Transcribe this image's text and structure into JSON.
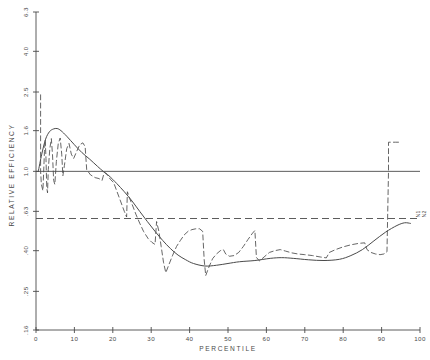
{
  "chart_data": {
    "type": "line",
    "title": "",
    "xlabel": "PERCENTILE",
    "ylabel": "RELATIVE  EFFICIENCY",
    "xlim": [
      0,
      100
    ],
    "ylim_log": [
      0.16,
      6.3
    ],
    "yscale": "log",
    "grid": false,
    "legend": "none",
    "xticks": [
      "0",
      "10",
      "20",
      "30",
      "40",
      "50",
      "60",
      "70",
      "80",
      "90",
      "100"
    ],
    "xtick_values": [
      0,
      10,
      20,
      30,
      40,
      50,
      60,
      70,
      80,
      90,
      100
    ],
    "yticks": [
      "6.3",
      "4.0",
      "2.5",
      "1.6",
      "1.0",
      ".63",
      ".40",
      ".25",
      ".16"
    ],
    "ytick_values": [
      6.3,
      4.0,
      2.5,
      1.6,
      1.0,
      0.63,
      0.4,
      0.25,
      0.16
    ],
    "right_annotation": "N1 N2",
    "right_annotation_line1": "N1",
    "right_annotation_line2": "N2",
    "reference_lines": [
      {
        "name": "unity-line",
        "y": 1.0,
        "style": "solid"
      },
      {
        "name": "lower-reference-line",
        "y": 0.58,
        "style": "dashed"
      }
    ],
    "series": [
      {
        "name": "smooth-efficiency-curve",
        "style": "solid",
        "points": [
          [
            0.6,
            1.0
          ],
          [
            1.5,
            1.22
          ],
          [
            2.5,
            1.45
          ],
          [
            3.5,
            1.58
          ],
          [
            4.5,
            1.63
          ],
          [
            5.5,
            1.64
          ],
          [
            6.5,
            1.6
          ],
          [
            8.0,
            1.5
          ],
          [
            10.0,
            1.36
          ],
          [
            12.0,
            1.24
          ],
          [
            14.0,
            1.15
          ],
          [
            16.0,
            1.06
          ],
          [
            17.5,
            1.0
          ],
          [
            19.0,
            0.95
          ],
          [
            21.0,
            0.87
          ],
          [
            23.0,
            0.79
          ],
          [
            25.0,
            0.71
          ],
          [
            27.0,
            0.63
          ],
          [
            29.0,
            0.56
          ],
          [
            31.0,
            0.5
          ],
          [
            33.0,
            0.45
          ],
          [
            35.0,
            0.41
          ],
          [
            37.0,
            0.38
          ],
          [
            39.0,
            0.36
          ],
          [
            41.0,
            0.345
          ],
          [
            44.0,
            0.335
          ],
          [
            47.0,
            0.338
          ],
          [
            50.0,
            0.345
          ],
          [
            53.0,
            0.352
          ],
          [
            57.0,
            0.357
          ],
          [
            61.0,
            0.366
          ],
          [
            64.0,
            0.369
          ],
          [
            67.0,
            0.366
          ],
          [
            71.0,
            0.36
          ],
          [
            75.0,
            0.357
          ],
          [
            79.0,
            0.362
          ],
          [
            82.0,
            0.378
          ],
          [
            85.0,
            0.405
          ],
          [
            88.0,
            0.448
          ],
          [
            91.0,
            0.495
          ],
          [
            94.0,
            0.535
          ],
          [
            96.0,
            0.552
          ],
          [
            97.5,
            0.548
          ]
        ]
      },
      {
        "name": "empirical-efficiency-curve",
        "style": "dashed",
        "points": [
          [
            1.2,
            2.42
          ],
          [
            1.2,
            1.0
          ],
          [
            1.4,
            0.86
          ],
          [
            1.8,
            0.8
          ],
          [
            2.0,
            1.0
          ],
          [
            2.2,
            1.26
          ],
          [
            2.4,
            1.44
          ],
          [
            2.6,
            1.16
          ],
          [
            2.8,
            0.83
          ],
          [
            3.0,
            0.78
          ],
          [
            3.2,
            1.02
          ],
          [
            3.6,
            1.3
          ],
          [
            4.0,
            1.46
          ],
          [
            4.3,
            1.21
          ],
          [
            4.6,
            0.9
          ],
          [
            4.9,
            0.86
          ],
          [
            5.3,
            1.12
          ],
          [
            5.8,
            1.38
          ],
          [
            6.3,
            1.47
          ],
          [
            6.7,
            1.22
          ],
          [
            7.0,
            0.95
          ],
          [
            7.4,
            1.07
          ],
          [
            8.0,
            1.3
          ],
          [
            8.6,
            1.38
          ],
          [
            9.2,
            1.22
          ],
          [
            9.8,
            1.16
          ],
          [
            10.6,
            1.26
          ],
          [
            11.4,
            1.36
          ],
          [
            12.2,
            1.39
          ],
          [
            12.8,
            1.33
          ],
          [
            13.2,
            1.02
          ],
          [
            14.2,
            0.96
          ],
          [
            15.4,
            0.93
          ],
          [
            16.4,
            0.92
          ],
          [
            17.2,
            0.9
          ],
          [
            17.8,
            0.99
          ],
          [
            18.6,
            0.96
          ],
          [
            19.4,
            0.91
          ],
          [
            20.2,
            0.88
          ],
          [
            21.0,
            0.8
          ],
          [
            22.0,
            0.71
          ],
          [
            23.0,
            0.63
          ],
          [
            23.6,
            0.59
          ],
          [
            23.8,
            0.79
          ],
          [
            24.4,
            0.73
          ],
          [
            25.2,
            0.67
          ],
          [
            26.0,
            0.61
          ],
          [
            27.0,
            0.55
          ],
          [
            28.0,
            0.5
          ],
          [
            29.2,
            0.46
          ],
          [
            30.2,
            0.44
          ],
          [
            31.0,
            0.43
          ],
          [
            31.4,
            0.56
          ],
          [
            32.0,
            0.5
          ],
          [
            32.6,
            0.42
          ],
          [
            33.2,
            0.35
          ],
          [
            33.8,
            0.31
          ],
          [
            34.6,
            0.34
          ],
          [
            35.6,
            0.38
          ],
          [
            36.6,
            0.42
          ],
          [
            37.6,
            0.45
          ],
          [
            38.6,
            0.48
          ],
          [
            39.6,
            0.5
          ],
          [
            40.6,
            0.51
          ],
          [
            41.6,
            0.515
          ],
          [
            42.6,
            0.515
          ],
          [
            43.4,
            0.5
          ],
          [
            43.8,
            0.36
          ],
          [
            44.2,
            0.3
          ],
          [
            45.0,
            0.33
          ],
          [
            46.0,
            0.365
          ],
          [
            47.0,
            0.385
          ],
          [
            48.0,
            0.4
          ],
          [
            48.8,
            0.405
          ],
          [
            49.4,
            0.385
          ],
          [
            50.4,
            0.375
          ],
          [
            51.6,
            0.378
          ],
          [
            52.8,
            0.392
          ],
          [
            54.0,
            0.42
          ],
          [
            55.2,
            0.455
          ],
          [
            56.4,
            0.49
          ],
          [
            57.0,
            0.505
          ],
          [
            57.4,
            0.37
          ],
          [
            58.2,
            0.355
          ],
          [
            59.4,
            0.372
          ],
          [
            60.8,
            0.392
          ],
          [
            62.2,
            0.4
          ],
          [
            63.6,
            0.405
          ],
          [
            65.0,
            0.398
          ],
          [
            66.6,
            0.39
          ],
          [
            68.2,
            0.385
          ],
          [
            70.0,
            0.382
          ],
          [
            72.0,
            0.378
          ],
          [
            74.0,
            0.372
          ],
          [
            75.6,
            0.368
          ],
          [
            76.4,
            0.392
          ],
          [
            78.0,
            0.405
          ],
          [
            80.0,
            0.418
          ],
          [
            82.0,
            0.428
          ],
          [
            84.0,
            0.435
          ],
          [
            85.6,
            0.438
          ],
          [
            86.2,
            0.405
          ],
          [
            87.2,
            0.392
          ],
          [
            88.4,
            0.385
          ],
          [
            89.6,
            0.382
          ],
          [
            90.6,
            0.385
          ],
          [
            91.4,
            0.395
          ],
          [
            91.8,
            1.0
          ],
          [
            91.8,
            1.4
          ],
          [
            93.6,
            1.4
          ],
          [
            95.2,
            1.4
          ]
        ]
      }
    ]
  }
}
